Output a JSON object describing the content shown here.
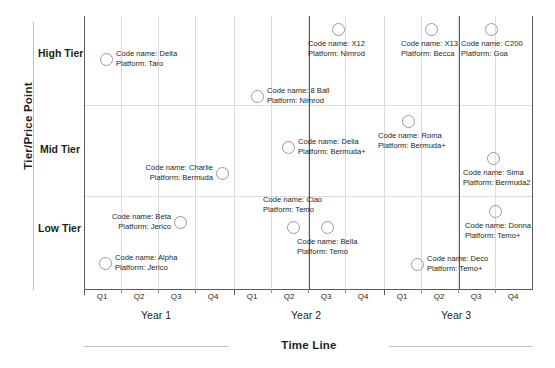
{
  "chart_data": {
    "type": "scatter",
    "title": "",
    "xlabel": "Time Line",
    "ylabel": "Tier/Price Point",
    "grid": true,
    "legend_position": "none",
    "x_categories": [
      "Q1",
      "Q2",
      "Q3",
      "Q4",
      "Q1",
      "Q2",
      "Q3",
      "Q4",
      "Q1",
      "Q2",
      "Q3",
      "Q4"
    ],
    "x_groups": [
      "Year 1",
      "Year 2",
      "Year 3"
    ],
    "y_categories": [
      "High Tier",
      "Mid Tier",
      "Low Tier"
    ],
    "points": [
      {
        "code_name": "Delta",
        "platform": "Taro",
        "year": "Year 1",
        "quarter": "Q1",
        "tier": "High Tier",
        "label_side": "right",
        "cx": 106,
        "cy": 59
      },
      {
        "code_name": "Charlie",
        "platform": "Bermuda",
        "year": "Year 1",
        "quarter": "Q3",
        "tier": "Mid Tier",
        "label_side": "left",
        "cx": 222,
        "cy": 173
      },
      {
        "code_name": "Beta",
        "platform": "Jerico",
        "year": "Year 1",
        "quarter": "Q3",
        "tier": "Low Tier",
        "label_side": "left",
        "cx": 180,
        "cy": 222
      },
      {
        "code_name": "Alpha",
        "platform": "Jerico",
        "year": "Year 1",
        "quarter": "Q1",
        "tier": "Low Tier",
        "label_side": "right",
        "cx": 105,
        "cy": 263
      },
      {
        "code_name": "8 Ball",
        "platform": "Nimrod",
        "year": "Year 2",
        "quarter": "Q1",
        "tier": "High Tier",
        "label_side": "right",
        "cx": 257,
        "cy": 96
      },
      {
        "code_name": "X12",
        "platform": "Nimrod",
        "year": "Year 2",
        "quarter": "Q3",
        "tier": "High Tier",
        "label_side": "below",
        "cx": 338,
        "cy": 29
      },
      {
        "code_name": "Delia",
        "platform": "Bermuda+",
        "year": "Year 2",
        "quarter": "Q2",
        "tier": "Mid Tier",
        "label_side": "right",
        "cx": 288,
        "cy": 147
      },
      {
        "code_name": "Ciao",
        "platform": "Temo",
        "year": "Year 2",
        "quarter": "Q2",
        "tier": "Low Tier",
        "label_side": "above",
        "cx": 293,
        "cy": 227
      },
      {
        "code_name": "Bella",
        "platform": "Temo",
        "year": "Year 2",
        "quarter": "Q3",
        "tier": "Low Tier",
        "label_side": "below",
        "cx": 327,
        "cy": 227
      },
      {
        "code_name": "X13",
        "platform": "Becca",
        "year": "Year 3",
        "quarter": "Q2",
        "tier": "High Tier",
        "label_side": "below",
        "cx": 431,
        "cy": 29
      },
      {
        "code_name": "C200",
        "platform": "Goa",
        "year": "Year 3",
        "quarter": "Q3",
        "tier": "High Tier",
        "label_side": "below",
        "cx": 491,
        "cy": 29
      },
      {
        "code_name": "Roma",
        "platform": "Bermuda+",
        "year": "Year 3",
        "quarter": "Q1",
        "tier": "Mid Tier",
        "label_side": "below",
        "cx": 408,
        "cy": 121
      },
      {
        "code_name": "Sima",
        "platform": "Bermuda2",
        "year": "Year 3",
        "quarter": "Q3",
        "tier": "Mid Tier",
        "label_side": "below",
        "cx": 493,
        "cy": 158
      },
      {
        "code_name": "Donna",
        "platform": "Temo+",
        "year": "Year 3",
        "quarter": "Q3",
        "tier": "Low Tier",
        "label_side": "below",
        "cx": 495,
        "cy": 211
      },
      {
        "code_name": "Deco",
        "platform": "Temo+",
        "year": "Year 3",
        "quarter": "Q2",
        "tier": "Low Tier",
        "label_side": "right",
        "cx": 417,
        "cy": 264
      }
    ],
    "point_label_prefixes": {
      "code": "Code name:",
      "platform": "Platform:"
    }
  },
  "axes": {
    "y_title": "Tier/Price Point",
    "x_title": "Time Line",
    "tiers": [
      {
        "label": "High Tier",
        "top": 47
      },
      {
        "label": "Mid Tier",
        "top": 143
      },
      {
        "label": "Low Tier",
        "top": 222
      }
    ],
    "quarters": [
      {
        "label": "Q1",
        "left": 84
      },
      {
        "label": "Q2",
        "left": 121
      },
      {
        "label": "Q3",
        "left": 158
      },
      {
        "label": "Q4",
        "left": 195
      },
      {
        "label": "Q1",
        "left": 234
      },
      {
        "label": "Q2",
        "left": 271
      },
      {
        "label": "Q3",
        "left": 308
      },
      {
        "label": "Q4",
        "left": 345
      },
      {
        "label": "Q1",
        "left": 384
      },
      {
        "label": "Q2",
        "left": 421
      },
      {
        "label": "Q3",
        "left": 458
      },
      {
        "label": "Q4",
        "left": 495
      }
    ],
    "years": [
      {
        "label": "Year 1",
        "left": 101
      },
      {
        "label": "Year 2",
        "left": 251
      },
      {
        "label": "Year 3",
        "left": 401
      }
    ]
  },
  "colors": {
    "frame": "#5a5a5a",
    "grid": "#dcdcdc",
    "axis": "#bfbfbf",
    "point_stroke": "#9a9a9a",
    "text": "#231f20",
    "background": "#ffffff"
  }
}
